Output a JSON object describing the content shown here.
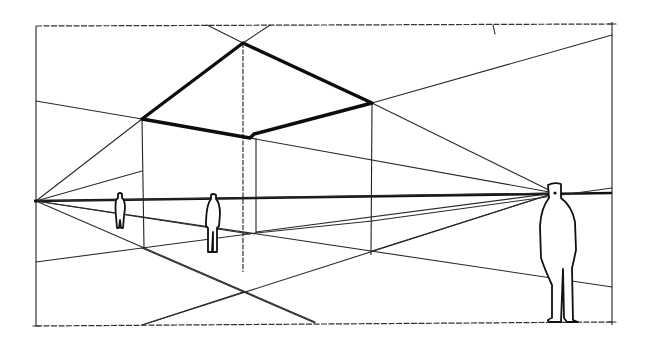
{
  "diagram": {
    "type": "two-point-perspective-sketch",
    "colors": {
      "ink": "#111111",
      "paper": "#ffffff"
    },
    "frame": {
      "left": 36,
      "top": 25,
      "right": 612,
      "bottom": 325
    },
    "horizon_line": {
      "from": [
        36,
        201
      ],
      "to": [
        612,
        193
      ]
    },
    "vanishing_points": [
      {
        "name": "left-vanishing-point",
        "x": 36,
        "y": 201
      },
      {
        "name": "right-vanishing-point",
        "x": 555,
        "y": 193
      }
    ],
    "roof_outline": {
      "top": [
        243,
        43
      ],
      "left": [
        142,
        119
      ],
      "front": [
        250,
        138
      ],
      "right": [
        372,
        103
      ]
    },
    "figures": [
      {
        "name": "small-distant-figure",
        "x": 120,
        "foot_y": 230,
        "height": 33
      },
      {
        "name": "middle-figure",
        "x": 213,
        "foot_y": 252,
        "height": 58
      },
      {
        "name": "large-foreground-figure",
        "x": 556,
        "foot_y": 322,
        "height": 138
      }
    ],
    "labels": []
  }
}
